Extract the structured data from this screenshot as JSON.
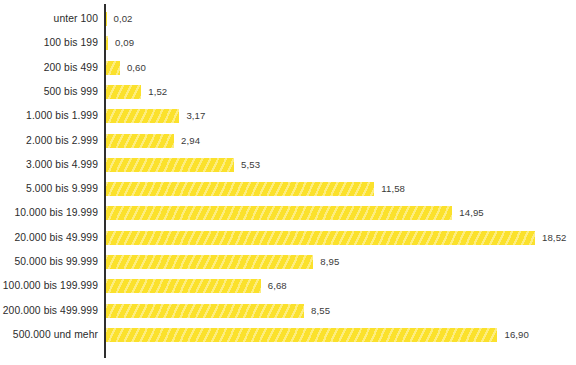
{
  "chart_data": {
    "type": "bar",
    "orientation": "horizontal",
    "title": "",
    "subtitle": "",
    "xlabel": "",
    "ylabel": "",
    "grid": false,
    "legend": false,
    "legend_position": "none",
    "xlim": [
      0,
      18.52
    ],
    "decimal_separator": ",",
    "bar_color": "#FBE12C",
    "bar_pattern": "diagonal-hatch",
    "axis_color": "#2E2E2E",
    "label_color": "#2B2B2B",
    "value_label_color": "#3A3A3A",
    "background": "#FFFFFF",
    "categories": [
      "unter 100",
      "100 bis 199",
      "200 bis 499",
      "500 bis 999",
      "1.000 bis 1.999",
      "2.000 bis 2.999",
      "3.000 bis 4.999",
      "5.000 bis 9.999",
      "10.000 bis 19.999",
      "20.000 bis 49.999",
      "50.000 bis 99.999",
      "100.000 bis 199.999",
      "200.000 bis 499.999",
      "500.000 und mehr"
    ],
    "values": [
      0.02,
      0.09,
      0.6,
      1.52,
      3.17,
      2.94,
      5.53,
      11.58,
      14.95,
      18.52,
      8.95,
      6.68,
      8.55,
      16.9
    ],
    "value_labels": [
      "0,02",
      "0,09",
      "0,60",
      "1,52",
      "3,17",
      "2,94",
      "5,53",
      "11,58",
      "14,95",
      "18,52",
      "8,95",
      "6,68",
      "8,55",
      "16,90"
    ]
  }
}
